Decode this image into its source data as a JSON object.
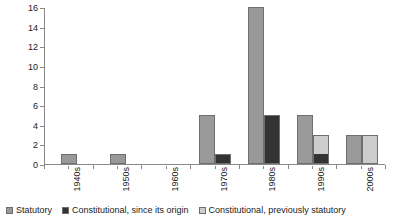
{
  "chart_data": {
    "type": "bar",
    "title": "",
    "subtitle": "",
    "xlabel": "",
    "ylabel": "",
    "ylim": [
      0,
      16
    ],
    "ytick_step": 2,
    "yticks": [
      0,
      2,
      4,
      6,
      8,
      10,
      12,
      14,
      16
    ],
    "ytick_labels": [
      "0",
      "2",
      "4",
      "6",
      "8",
      "10",
      "12",
      "14",
      "16"
    ],
    "grid": false,
    "legend_position": "bottom",
    "stacked_groups": true,
    "categories": [
      "1940s",
      "1950s",
      "1960s",
      "1970s",
      "1980s",
      "1990s",
      "2000s"
    ],
    "series": [
      {
        "name": "Statutory",
        "color": "#999999",
        "values": [
          1,
          1,
          0,
          5,
          16,
          5,
          3
        ]
      },
      {
        "name": "Constitutional, since its origin",
        "color": "#333333",
        "values": [
          0,
          0,
          0,
          1,
          5,
          1,
          0
        ]
      },
      {
        "name": "Constitutional, previously statutory",
        "color": "#cccccc",
        "values": [
          0,
          0,
          0,
          0,
          0,
          2,
          3
        ]
      }
    ]
  },
  "legend": {
    "items": [
      {
        "label": "Statutory",
        "color": "#999999"
      },
      {
        "label": "Constitutional, since its origin",
        "color": "#333333"
      },
      {
        "label": "Constitutional, previously statutory",
        "color": "#cccccc"
      }
    ]
  },
  "axes": {
    "y_tick_labels": [
      "0",
      "2",
      "4",
      "6",
      "8",
      "10",
      "12",
      "14",
      "16"
    ],
    "x_tick_labels": [
      "1940s",
      "1950s",
      "1960s",
      "1970s",
      "1980s",
      "1990s",
      "2000s"
    ]
  },
  "colors": {
    "statutory": "#999999",
    "constitutional_origin": "#333333",
    "constitutional_previously": "#cccccc",
    "axis": "#8a8a8a",
    "bar_border": "#6e6e6e",
    "background": "#ffffff"
  }
}
